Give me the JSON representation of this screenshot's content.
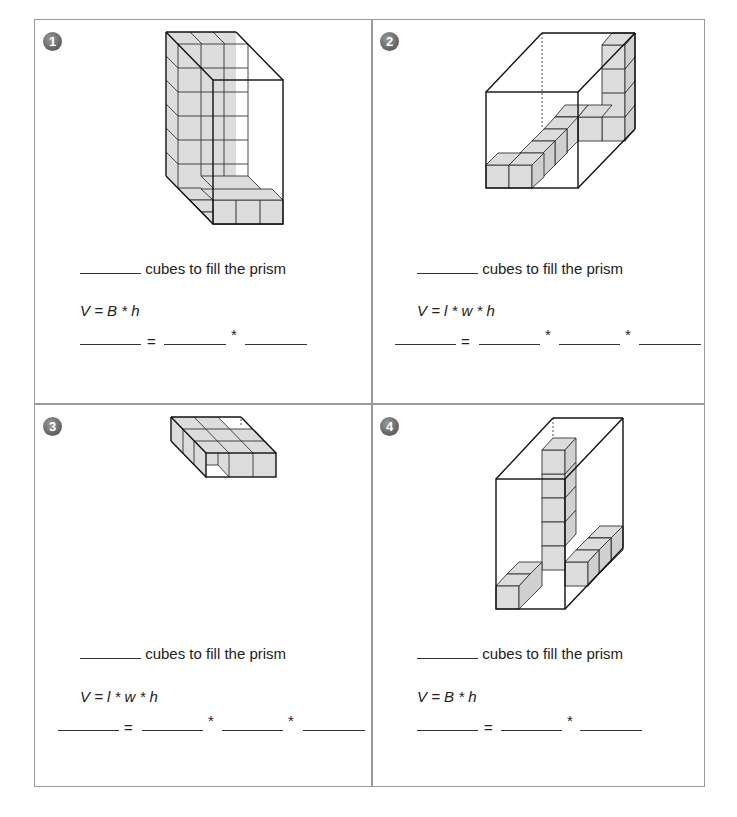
{
  "worksheet": {
    "problems": [
      {
        "number": "1",
        "fill_text": "cubes to fill the prism",
        "formula": "V = B * h",
        "equation": {
          "equals": "=",
          "ops": [
            "*"
          ]
        }
      },
      {
        "number": "2",
        "fill_text": "cubes to fill the prism",
        "formula": "V = l * w * h",
        "equation": {
          "equals": "=",
          "ops": [
            "*",
            "*"
          ]
        }
      },
      {
        "number": "3",
        "fill_text": "cubes to fill the prism",
        "formula": "V = l * w * h",
        "equation": {
          "equals": "=",
          "ops": [
            "*",
            "*"
          ]
        }
      },
      {
        "number": "4",
        "fill_text": "cubes to fill the prism",
        "formula": "V = B * h",
        "equation": {
          "equals": "=",
          "ops": [
            "*"
          ]
        }
      }
    ],
    "colors": {
      "cube_fill": "#dcdcdc",
      "edge": "#222222",
      "border": "#9a9a9a",
      "badge": "#666666"
    }
  }
}
